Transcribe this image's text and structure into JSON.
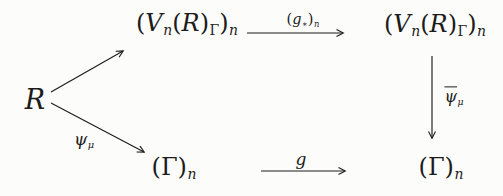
{
  "colors": {
    "background": "#fcfcfa",
    "ink": "#1c1c1c"
  },
  "nodes": {
    "source": {
      "label": "R"
    },
    "top_left": {
      "p1": "(",
      "v": "V",
      "s1": "n",
      "p2": "(",
      "r": "R",
      "p3": ")",
      "s2": "Γ",
      "p4": ")",
      "s3": "n"
    },
    "top_right": {
      "p1": "(",
      "v": "V",
      "s1": "n",
      "p2": "(",
      "r": "R",
      "p3": ")",
      "s2": "Γ",
      "p4": ")",
      "s3": "n"
    },
    "bottom_left": {
      "p1": "(",
      "g": "Γ",
      "p2": ")",
      "s": "n"
    },
    "bottom_right": {
      "p1": "(",
      "g": "Γ",
      "p2": ")",
      "s": "n"
    }
  },
  "arrows": {
    "top": {
      "p1": "(",
      "g": "g",
      "star": "∗",
      "p2": ")",
      "s": "n"
    },
    "bottom": {
      "label": "g"
    },
    "right_vertical": {
      "base": "ψ",
      "bar": true,
      "sub": "μ"
    },
    "lower_diagonal": {
      "base": "ψ",
      "sub": "μ"
    }
  }
}
